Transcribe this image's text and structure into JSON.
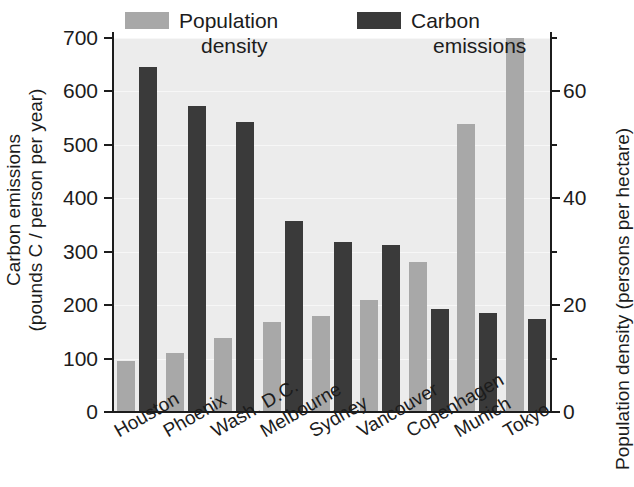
{
  "chart_data": {
    "type": "bar",
    "title": "",
    "subtitle": "",
    "orientation": "vertical",
    "grouping": "grouped",
    "grid": true,
    "legend_position": "top-inside",
    "categories": [
      "Houston",
      "Phoenix",
      "Wash. D.C.",
      "Melbourne",
      "Sydney",
      "Vancouver",
      "Copenhagen",
      "Munich",
      "Tokyo"
    ],
    "series": [
      {
        "name": "Population density",
        "axis": "right",
        "unit": "persons per hectare",
        "color": "#a8a8a8",
        "values": [
          9.5,
          11,
          13.8,
          16.8,
          18,
          21,
          28,
          54,
          70
        ]
      },
      {
        "name": "Carbon emissions",
        "axis": "left",
        "unit": "pounds C / person per year",
        "color": "#3a3a3a",
        "values": [
          645,
          572,
          542,
          358,
          318,
          312,
          192,
          185,
          175
        ]
      }
    ],
    "left_axis": {
      "title_line1": "Carbon emissions",
      "title_line2": "(pounds C / person per year)",
      "ticks": [
        0,
        100,
        200,
        300,
        400,
        500,
        600,
        700
      ],
      "tick_labels": [
        "0",
        "100",
        "200",
        "300",
        "400",
        "500",
        "600",
        "700"
      ],
      "ylim": [
        0,
        700
      ]
    },
    "right_axis": {
      "title": "Population density (persons per hectare)",
      "ticks": [
        0,
        20,
        40,
        60
      ],
      "tick_labels": [
        "0",
        "20",
        "40",
        "60"
      ],
      "minor_ticks": [
        10,
        30,
        50,
        70
      ],
      "ylim": [
        0,
        70
      ]
    },
    "xlabel": "",
    "plot_background": "#ececec",
    "page_background": "#ffffff"
  },
  "legend": {
    "items": [
      {
        "label_line1": "Population",
        "label_line2": "density",
        "color": "#a8a8a8",
        "swatch": "light-gray-swatch"
      },
      {
        "label_line1": "Carbon",
        "label_line2": "emissions",
        "color": "#3a3a3a",
        "swatch": "dark-gray-swatch"
      }
    ]
  }
}
